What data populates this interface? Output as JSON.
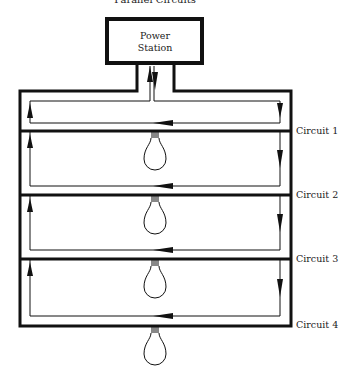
{
  "title": "Parallel Circuits",
  "power_station": {
    "line1": "Power",
    "line2": "Station"
  },
  "circuits": [
    {
      "label": "Circuit 1"
    },
    {
      "label": "Circuit 2"
    },
    {
      "label": "Circuit 3"
    },
    {
      "label": "Circuit 4"
    }
  ],
  "colors": {
    "ink": "#111111",
    "background": "#ffffff"
  }
}
